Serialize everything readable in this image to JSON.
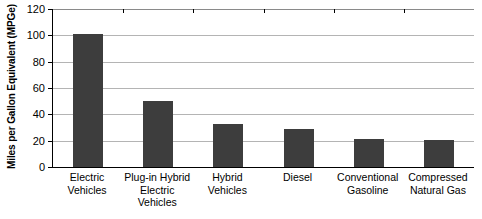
{
  "chart_data": {
    "type": "bar",
    "title": "",
    "xlabel": "",
    "ylabel": "Miles per Gallon Equivalent (MPGe)",
    "ylim": [
      0,
      120
    ],
    "ytick_step": 20,
    "yticks": [
      "120",
      "100",
      "80",
      "60",
      "40",
      "20",
      "0"
    ],
    "grid": true,
    "legend": false,
    "bar_color": "#3d3d3d",
    "categories": [
      "Electric Vehicles",
      "Plug-in Hybrid Electric Vehicles",
      "Hybrid Vehicles",
      "Diesel",
      "Conventional Gasoline",
      "Compressed Natural Gas"
    ],
    "category_lines": [
      {
        "line1": "Electric Vehicles",
        "line2": ""
      },
      {
        "line1": "Plug-in Hybrid",
        "line2": "Electric Vehicles"
      },
      {
        "line1": "Hybrid Vehicles",
        "line2": ""
      },
      {
        "line1": "Diesel",
        "line2": ""
      },
      {
        "line1": "Conventional",
        "line2": "Gasoline"
      },
      {
        "line1": "Compressed",
        "line2": "Natural Gas"
      }
    ],
    "values": [
      101,
      50,
      32.5,
      28.5,
      21,
      20.5
    ]
  }
}
